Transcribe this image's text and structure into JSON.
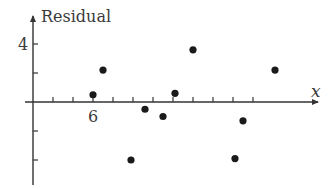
{
  "chart_data": {
    "type": "scatter",
    "title": "",
    "xlabel": "x",
    "ylabel": "Residual",
    "x_tick_labels": [
      {
        "value": 6,
        "label": "6"
      }
    ],
    "y_tick_labels": [
      {
        "value": 4,
        "label": "4"
      }
    ],
    "x_ticks": [
      4,
      5,
      6,
      7,
      8,
      9,
      10,
      11,
      12,
      13,
      14
    ],
    "y_ticks": [
      -4,
      -2,
      2,
      4
    ],
    "xlim": [
      3,
      17
    ],
    "ylim": [
      -6,
      5
    ],
    "grid": false,
    "legend": null,
    "series": [
      {
        "name": "Residuals",
        "x": [
          6.0,
          6.5,
          7.9,
          8.6,
          9.5,
          10.1,
          11.0,
          13.1,
          13.5,
          15.1
        ],
        "y": [
          0.5,
          2.2,
          -4.0,
          -0.5,
          -1.0,
          0.6,
          3.6,
          -3.9,
          -1.3,
          2.2
        ]
      }
    ]
  },
  "labels": {
    "ylabel": "Residual",
    "xlabel": "x",
    "x_tick_6": "6",
    "y_tick_4": "4"
  },
  "colors": {
    "axis": "#333333",
    "point": "#1a1a1a",
    "text": "#3a3a3a"
  }
}
